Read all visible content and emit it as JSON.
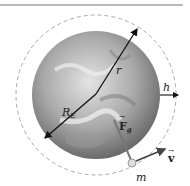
{
  "diagram": {
    "labels": {
      "r": "r",
      "radius_earth": "R",
      "radius_earth_sub": "E",
      "altitude": "h",
      "gravity_force": "F",
      "gravity_force_sub": "g",
      "velocity": "v",
      "mass": "m"
    },
    "colors": {
      "earth_light": "#d8d8d8",
      "earth_dark": "#6e6e6e",
      "orbit_dash": "#aaaaaa",
      "arrow": "#111111",
      "force_line": "#777777"
    }
  }
}
